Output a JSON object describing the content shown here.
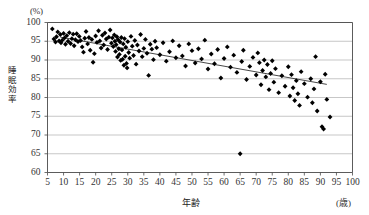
{
  "chart_data": {
    "type": "scatter",
    "title": "",
    "xlabel": "年齢",
    "ylabel": "睡眠効率",
    "x_unit": "(歳)",
    "y_unit": "(%)",
    "xlim": [
      5,
      100
    ],
    "ylim": [
      60,
      100
    ],
    "xticks": [
      5,
      10,
      15,
      20,
      25,
      30,
      35,
      40,
      45,
      50,
      55,
      60,
      65,
      70,
      75,
      80,
      85,
      90,
      95,
      100
    ],
    "yticks": [
      60,
      65,
      70,
      75,
      80,
      85,
      90,
      95,
      100
    ],
    "grid": "horizontal",
    "legend": "none",
    "marker": "diamond",
    "marker_color": "#000000",
    "trendline": {
      "type": "linear",
      "color": "#333333",
      "x_start": 9,
      "y_start": 96.1,
      "x_end": 92,
      "y_end": 83.5
    },
    "points": [
      [
        6.5,
        98.3
      ],
      [
        7.0,
        95.6
      ],
      [
        7.5,
        94.8
      ],
      [
        7.8,
        96.2
      ],
      [
        8.2,
        97.5
      ],
      [
        8.6,
        95.1
      ],
      [
        9.0,
        96.8
      ],
      [
        9.2,
        94.6
      ],
      [
        9.6,
        95.3
      ],
      [
        10.0,
        97.1
      ],
      [
        10.3,
        95.9
      ],
      [
        10.6,
        94.2
      ],
      [
        11.0,
        96.5
      ],
      [
        11.4,
        95.0
      ],
      [
        11.8,
        97.3
      ],
      [
        12.2,
        94.4
      ],
      [
        12.6,
        95.7
      ],
      [
        13.0,
        96.9
      ],
      [
        13.3,
        93.8
      ],
      [
        13.7,
        95.4
      ],
      [
        14.1,
        97.0
      ],
      [
        14.5,
        94.9
      ],
      [
        14.9,
        96.3
      ],
      [
        15.3,
        95.2
      ],
      [
        15.8,
        93.5
      ],
      [
        16.2,
        92.1
      ],
      [
        16.6,
        95.8
      ],
      [
        17.0,
        97.6
      ],
      [
        17.5,
        94.3
      ],
      [
        17.9,
        96.0
      ],
      [
        18.3,
        92.6
      ],
      [
        18.8,
        95.5
      ],
      [
        19.2,
        89.4
      ],
      [
        19.6,
        91.7
      ],
      [
        20.0,
        96.4
      ],
      [
        20.4,
        94.7
      ],
      [
        20.9,
        97.8
      ],
      [
        21.3,
        95.1
      ],
      [
        21.7,
        93.2
      ],
      [
        22.1,
        96.6
      ],
      [
        22.5,
        94.0
      ],
      [
        22.9,
        97.2
      ],
      [
        23.3,
        95.6
      ],
      [
        23.7,
        92.8
      ],
      [
        24.1,
        96.1
      ],
      [
        24.5,
        98.0
      ],
      [
        24.9,
        94.5
      ],
      [
        25.2,
        95.9
      ],
      [
        25.5,
        93.6
      ],
      [
        25.8,
        96.7
      ],
      [
        26.0,
        95.0
      ],
      [
        26.2,
        92.3
      ],
      [
        26.4,
        94.1
      ],
      [
        26.6,
        96.2
      ],
      [
        26.8,
        90.8
      ],
      [
        27.0,
        95.4
      ],
      [
        27.2,
        93.0
      ],
      [
        27.4,
        91.5
      ],
      [
        27.6,
        94.8
      ],
      [
        27.8,
        89.9
      ],
      [
        28.0,
        96.0
      ],
      [
        28.2,
        92.7
      ],
      [
        28.4,
        90.2
      ],
      [
        28.6,
        94.3
      ],
      [
        28.8,
        88.6
      ],
      [
        29.0,
        95.7
      ],
      [
        29.2,
        91.0
      ],
      [
        29.4,
        93.4
      ],
      [
        29.6,
        89.1
      ],
      [
        29.8,
        87.9
      ],
      [
        30.0,
        94.9
      ],
      [
        30.3,
        92.0
      ],
      [
        30.6,
        90.5
      ],
      [
        31.0,
        96.3
      ],
      [
        31.4,
        93.7
      ],
      [
        31.8,
        91.2
      ],
      [
        32.2,
        95.2
      ],
      [
        32.6,
        88.9
      ],
      [
        33.0,
        94.0
      ],
      [
        33.5,
        92.4
      ],
      [
        34.0,
        96.8
      ],
      [
        34.5,
        90.9
      ],
      [
        35.0,
        93.1
      ],
      [
        35.5,
        95.5
      ],
      [
        36.0,
        91.8
      ],
      [
        36.5,
        85.9
      ],
      [
        37.0,
        94.2
      ],
      [
        37.5,
        92.9
      ],
      [
        38.0,
        90.1
      ],
      [
        38.5,
        95.0
      ],
      [
        39.0,
        93.3
      ],
      [
        40.0,
        91.4
      ],
      [
        41.0,
        94.6
      ],
      [
        42.0,
        89.7
      ],
      [
        43.0,
        92.2
      ],
      [
        44.0,
        95.1
      ],
      [
        45.0,
        90.6
      ],
      [
        46.0,
        93.8
      ],
      [
        47.0,
        91.1
      ],
      [
        48.0,
        88.4
      ],
      [
        49.0,
        94.3
      ],
      [
        50.0,
        92.5
      ],
      [
        51.0,
        89.2
      ],
      [
        52.0,
        93.0
      ],
      [
        53.0,
        90.3
      ],
      [
        54.0,
        95.3
      ],
      [
        55.0,
        87.6
      ],
      [
        56.0,
        91.6
      ],
      [
        57.0,
        89.0
      ],
      [
        58.0,
        92.8
      ],
      [
        59.0,
        85.2
      ],
      [
        60.0,
        90.4
      ],
      [
        61.0,
        93.5
      ],
      [
        62.0,
        88.1
      ],
      [
        63.0,
        91.3
      ],
      [
        64.0,
        86.7
      ],
      [
        65.0,
        65.0
      ],
      [
        65.5,
        89.6
      ],
      [
        66.0,
        92.6
      ],
      [
        67.0,
        84.8
      ],
      [
        68.0,
        88.3
      ],
      [
        69.0,
        90.7
      ],
      [
        70.0,
        86.0
      ],
      [
        70.5,
        91.9
      ],
      [
        71.0,
        89.3
      ],
      [
        71.5,
        83.4
      ],
      [
        72.0,
        87.2
      ],
      [
        72.5,
        90.0
      ],
      [
        73.0,
        85.5
      ],
      [
        73.5,
        88.8
      ],
      [
        74.0,
        82.1
      ],
      [
        74.5,
        86.4
      ],
      [
        75.0,
        89.8
      ],
      [
        75.5,
        84.1
      ],
      [
        76.0,
        87.7
      ],
      [
        77.0,
        81.3
      ],
      [
        78.0,
        85.8
      ],
      [
        79.0,
        83.0
      ],
      [
        80.0,
        88.2
      ],
      [
        80.5,
        80.4
      ],
      [
        81.0,
        86.1
      ],
      [
        81.5,
        82.6
      ],
      [
        82.0,
        79.2
      ],
      [
        82.5,
        84.5
      ],
      [
        83.0,
        81.0
      ],
      [
        83.5,
        77.9
      ],
      [
        84.0,
        86.9
      ],
      [
        85.0,
        83.7
      ],
      [
        86.0,
        80.1
      ],
      [
        87.0,
        85.0
      ],
      [
        87.5,
        78.6
      ],
      [
        88.0,
        82.3
      ],
      [
        88.5,
        90.9
      ],
      [
        89.0,
        76.4
      ],
      [
        90.0,
        84.2
      ],
      [
        90.5,
        72.2
      ],
      [
        91.0,
        71.6
      ],
      [
        91.5,
        86.2
      ],
      [
        92.0,
        79.5
      ],
      [
        93.0,
        74.8
      ]
    ]
  }
}
